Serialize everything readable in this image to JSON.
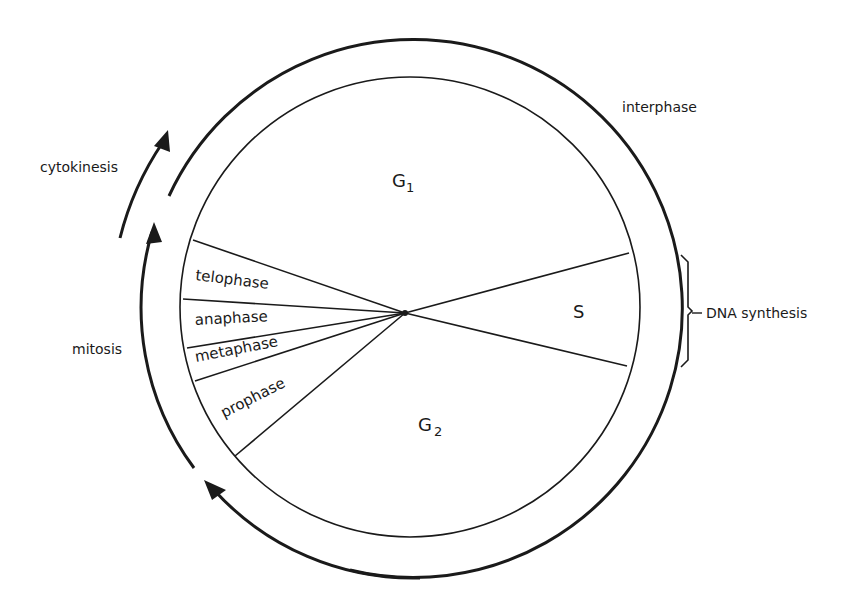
{
  "diagram": {
    "type": "cell-cycle",
    "colors": {
      "ink": "#1a1a1a",
      "background": "#ffffff"
    },
    "segments": {
      "g1": {
        "label": "G",
        "subscript": "1"
      },
      "s": {
        "label": "S"
      },
      "g2": {
        "label": "G",
        "subscript": "2"
      },
      "prophase": {
        "label": "prophase"
      },
      "metaphase": {
        "label": "metaphase"
      },
      "anaphase": {
        "label": "anaphase"
      },
      "telophase": {
        "label": "telophase"
      }
    },
    "annotations": {
      "interphase": "interphase",
      "dna_synthesis": "DNA synthesis",
      "cytokinesis": "cytokinesis",
      "mitosis": "mitosis"
    }
  }
}
